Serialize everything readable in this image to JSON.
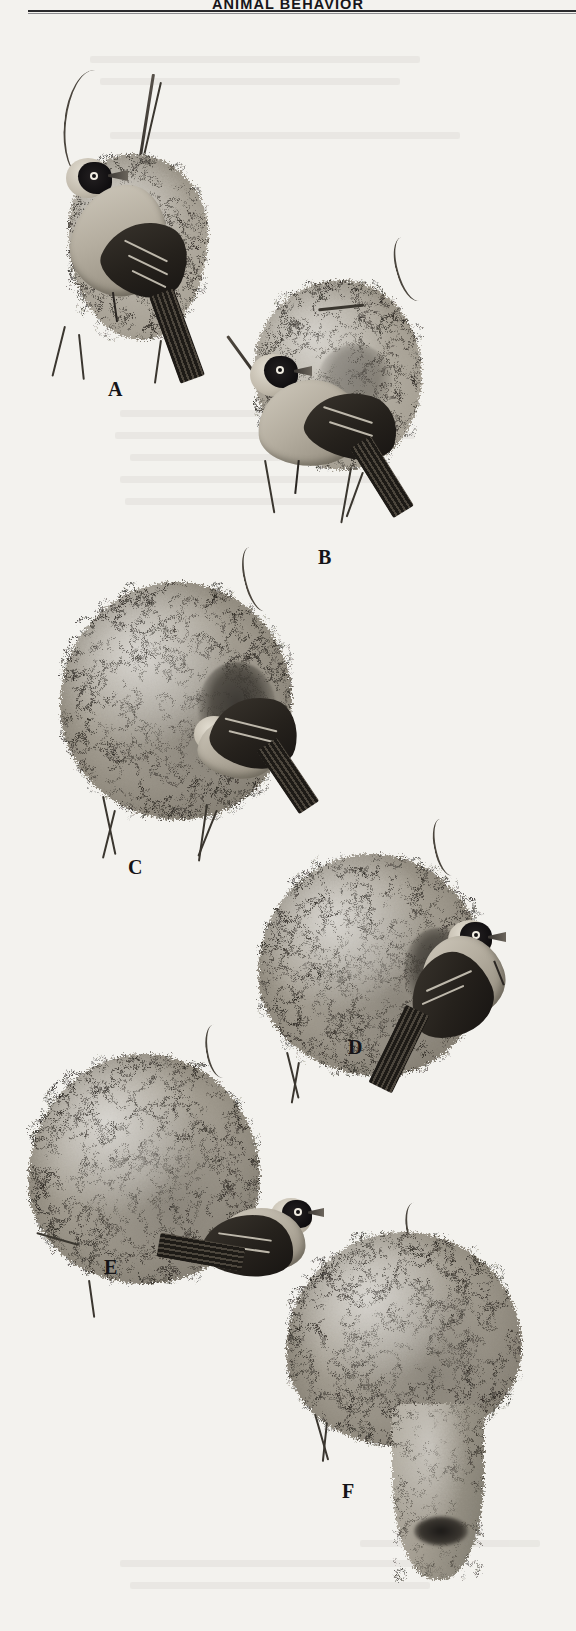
{
  "page": {
    "running_head": "ANIMAL BEHAVIOR",
    "background_color": "#f3f2ee",
    "rule_color": "#2a2a2c"
  },
  "figure": {
    "name": "weaver-bird-nest-building-sequence",
    "medium": "graphite / pencil illustration, grayscale halftone scan",
    "panels": [
      {
        "label": "A",
        "stage": "initial-ring",
        "description": "Bird perched on a vertical twig weaving the first grass ring; dark-masked head, long grass blade held in the bill."
      },
      {
        "label": "B",
        "stage": "ring-widened",
        "description": "The ring has been widened into an open loop; bird works from the far side adding strands."
      },
      {
        "label": "C",
        "stage": "roof-shell",
        "description": "Roof woven over the ring forming a rounded shell; bird hangs at the open front of the chamber."
      },
      {
        "label": "D",
        "stage": "egg-chamber",
        "description": "Nearly spherical nest with egg chamber closed; bird clings upside-down at the side entrance."
      },
      {
        "label": "E",
        "stage": "antechamber",
        "description": "Full ovoid nest with antechamber complete; bird perched at the bottom entrance."
      },
      {
        "label": "F",
        "stage": "entrance-tube",
        "description": "Finished nest with a long downward entrance tube woven below the chamber; no bird present."
      }
    ],
    "labels": [
      "A",
      "B",
      "C",
      "D",
      "E",
      "F"
    ]
  }
}
